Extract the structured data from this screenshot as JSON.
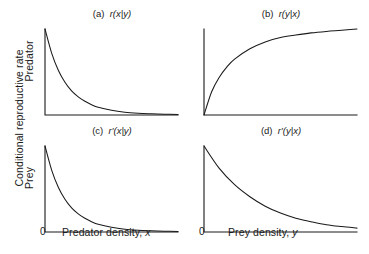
{
  "figure": {
    "y_axis_label": "Conditional reproductive rate",
    "row_labels": {
      "top": "Predator",
      "bottom": "Prey"
    },
    "x_axis_labels": {
      "left": "Predator density, x",
      "right": "Prey density, y"
    },
    "origin_tick": "0",
    "line_color": "#1a1a1a",
    "background_color": "#ffffff"
  },
  "panels": [
    {
      "tag": "(a)",
      "title": "(a)  r(x|y)",
      "func": "r(x|y)"
    },
    {
      "tag": "(b)",
      "title": "(b)  r(y|x)",
      "func": "r(y|x)"
    },
    {
      "tag": "(c)",
      "title": "(c)  r′(x|y)",
      "func": "r′(x|y)"
    },
    {
      "tag": "(d)",
      "title": "(d)  r′(y|x)",
      "func": "r′(y|x)"
    }
  ],
  "chart_data": [
    {
      "type": "line",
      "panel": "(a)",
      "title": "(a)  r(x|y)",
      "xlabel": "Predator density, x",
      "ylabel": "Conditional reproductive rate (Predator)",
      "grid": false,
      "legend": "none",
      "xlim": [
        0,
        1
      ],
      "ylim": [
        0,
        1
      ],
      "curve_form": "exponential decay",
      "x": [
        0,
        0.05,
        0.1,
        0.15,
        0.2,
        0.25,
        0.3,
        0.35,
        0.4,
        0.5,
        0.6,
        0.7,
        0.8,
        0.9,
        1.0
      ],
      "y": [
        1.0,
        0.72,
        0.52,
        0.38,
        0.28,
        0.21,
        0.16,
        0.12,
        0.09,
        0.055,
        0.033,
        0.021,
        0.014,
        0.009,
        0.006
      ]
    },
    {
      "type": "line",
      "panel": "(b)",
      "title": "(b)  r(y|x)",
      "xlabel": "Prey density, y",
      "ylabel": "Conditional reproductive rate (Predator)",
      "grid": false,
      "legend": "none",
      "xlim": [
        0,
        1
      ],
      "ylim": [
        0,
        1
      ],
      "curve_form": "saturating rise from origin",
      "x": [
        0,
        0.05,
        0.1,
        0.15,
        0.2,
        0.3,
        0.4,
        0.5,
        0.6,
        0.7,
        0.8,
        0.9,
        1.0
      ],
      "y": [
        0.0,
        0.27,
        0.44,
        0.56,
        0.65,
        0.77,
        0.85,
        0.9,
        0.93,
        0.955,
        0.972,
        0.985,
        1.0
      ]
    },
    {
      "type": "line",
      "panel": "(c)",
      "title": "(c)  r′(x|y)",
      "xlabel": "Predator density, x",
      "ylabel": "Conditional reproductive rate (Prey)",
      "grid": false,
      "legend": "none",
      "xlim": [
        0,
        1
      ],
      "ylim": [
        0,
        1
      ],
      "curve_form": "exponential decay",
      "x": [
        0,
        0.05,
        0.1,
        0.15,
        0.2,
        0.25,
        0.3,
        0.35,
        0.4,
        0.5,
        0.6,
        0.7,
        0.8,
        0.9,
        1.0
      ],
      "y": [
        1.0,
        0.72,
        0.52,
        0.38,
        0.28,
        0.21,
        0.16,
        0.12,
        0.09,
        0.055,
        0.033,
        0.021,
        0.014,
        0.009,
        0.006
      ]
    },
    {
      "type": "line",
      "panel": "(d)",
      "title": "(d)  r′(y|x)",
      "xlabel": "Prey density, y",
      "ylabel": "Conditional reproductive rate (Prey)",
      "grid": false,
      "legend": "none",
      "xlim": [
        0,
        1
      ],
      "ylim": [
        0,
        1
      ],
      "curve_form": "gentle exponential decay",
      "x": [
        0,
        0.1,
        0.2,
        0.3,
        0.4,
        0.5,
        0.6,
        0.7,
        0.8,
        0.9,
        1.0
      ],
      "y": [
        1.0,
        0.74,
        0.55,
        0.41,
        0.3,
        0.22,
        0.16,
        0.12,
        0.085,
        0.063,
        0.045
      ]
    }
  ]
}
